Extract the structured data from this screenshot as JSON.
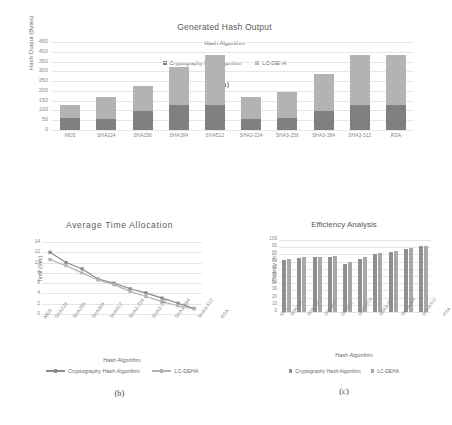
{
  "palette": {
    "series1": "#808080",
    "series2": "#b3b3b3",
    "series1_c": "#8f8f8f",
    "series2_c": "#a8a8a8",
    "grid": "#e6e6e6",
    "text": "#6b6b6b"
  },
  "series_names": {
    "s1": "Cryptography Hash Algorithm",
    "s2": "LC-DEHA"
  },
  "figures": {
    "a": {
      "caption": "(a)"
    },
    "b": {
      "caption": "(b)"
    },
    "c": {
      "caption": "(c)"
    }
  },
  "chart_data": [
    {
      "id": "a",
      "type": "bar",
      "stacked": true,
      "title": "Generated Hash Output",
      "xlabel": "Hash Algorithm",
      "ylabel": "Hash Output (Bytes)",
      "ylim": [
        0,
        450
      ],
      "yticks": [
        0,
        50,
        100,
        150,
        200,
        250,
        300,
        350,
        400,
        450
      ],
      "grid": true,
      "legend_position": "bottom",
      "categories": [
        "MD5",
        "SHA224",
        "SHA256",
        "SHA384",
        "SHA512",
        "SHA3-224",
        "SHA3-256",
        "SHA3-384",
        "SHA3-512",
        "RSA"
      ],
      "series": [
        {
          "name": "Cryptography Hash Algorithm",
          "color": "#808080",
          "values": [
            64,
            56,
            96,
            128,
            128,
            56,
            64,
            96,
            128,
            128
          ]
        },
        {
          "name": "LC-DEHA",
          "color": "#b3b3b3",
          "values": [
            64,
            112,
            128,
            192,
            256,
            112,
            128,
            192,
            256,
            256
          ]
        }
      ],
      "totals": [
        128,
        168,
        224,
        320,
        384,
        168,
        192,
        288,
        384,
        384
      ]
    },
    {
      "id": "b",
      "type": "line",
      "title": "Average Time Allocation",
      "xlabel": "Hash Algorithm",
      "ylabel": "Time (Sec)",
      "ylim": [
        0,
        14
      ],
      "yticks": [
        0,
        2,
        4,
        6,
        8,
        10,
        12,
        14
      ],
      "grid": true,
      "legend_position": "bottom",
      "x": [
        "MD5",
        "SHA224",
        "SHA256",
        "SHA384",
        "SHA512",
        "SHA3-224",
        "SHA3-256",
        "SHA3-384",
        "SHA3-512",
        "RSA"
      ],
      "series": [
        {
          "name": "Cryptography Hash Algorithm",
          "color": "#8a8a8a",
          "values": [
            12.0,
            10.0,
            8.8,
            6.8,
            6.0,
            4.9,
            4.1,
            3.1,
            2.1,
            1.1
          ]
        },
        {
          "name": "LC-DEHA",
          "color": "#b3b3b3",
          "values": [
            10.6,
            9.4,
            8.0,
            6.6,
            5.7,
            4.4,
            3.4,
            2.4,
            1.6,
            1.0
          ]
        }
      ]
    },
    {
      "id": "c",
      "type": "bar",
      "stacked": false,
      "title": "Efficiency Analysis",
      "xlabel": "Hash Algorithm",
      "ylabel": "Efficiency (%)",
      "ylim": [
        0,
        100
      ],
      "yticks": [
        0,
        10,
        20,
        30,
        40,
        50,
        60,
        70,
        80,
        90,
        100
      ],
      "grid": true,
      "legend_position": "bottom",
      "categories": [
        "MD5",
        "SHA224",
        "SHA256",
        "SHA384",
        "SHA512",
        "SHA3-224",
        "SHA3-256",
        "SHA3-384",
        "SHA3-512",
        "RSA"
      ],
      "series": [
        {
          "name": "Cryptography Hash Algorithm",
          "color": "#8f8f8f",
          "values": [
            72,
            75,
            76,
            77,
            66,
            74,
            80,
            83,
            87,
            91
          ]
        },
        {
          "name": "LC-DEHA",
          "color": "#a8a8a8",
          "values": [
            74,
            77,
            77,
            78,
            70,
            76,
            82,
            85,
            89,
            92
          ]
        }
      ]
    }
  ]
}
